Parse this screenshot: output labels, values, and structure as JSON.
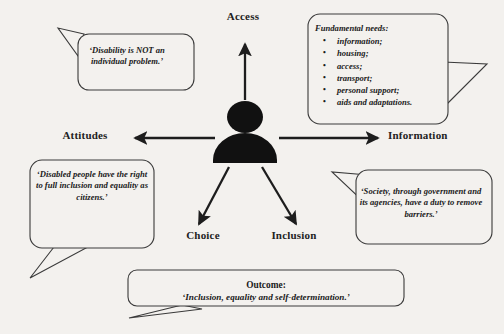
{
  "diagram": {
    "colors": {
      "background": "#f3f1ee",
      "stroke": "#3a3a3a",
      "figure": "#111111",
      "text": "#1a1a1a"
    }
  },
  "center": {
    "icon": "person-icon",
    "label": "person"
  },
  "spokes": [
    {
      "id": "access",
      "label": "Access",
      "direction": "up"
    },
    {
      "id": "attitudes",
      "label": "Attitudes",
      "direction": "left"
    },
    {
      "id": "information",
      "label": "Information",
      "direction": "right"
    },
    {
      "id": "choice",
      "label": "Choice",
      "direction": "down-left"
    },
    {
      "id": "inclusion",
      "label": "Inclusion",
      "direction": "down-right"
    }
  ],
  "bubbles": {
    "top_left": {
      "text": "‘Disability is NOT an individual problem.’",
      "tail": "up-left"
    },
    "top_right": {
      "heading": "Fundamental needs:",
      "bullet_glyph": "•",
      "items": [
        "information;",
        "housing;",
        "access;",
        "transport;",
        "personal support;",
        "aids and adaptations."
      ],
      "tail": "right"
    },
    "bottom_left": {
      "text": "‘Disabled people have the right to full inclusion and equality as citizens.’",
      "tail": "down-left"
    },
    "bottom_right": {
      "text": "‘Society, through government and its agencies, have a duty to remove barriers.’",
      "tail": "up-left"
    }
  },
  "outcome": {
    "title": "Outcome:",
    "quote": "‘Inclusion, equality and self-determination.’",
    "tail": "down-left"
  }
}
